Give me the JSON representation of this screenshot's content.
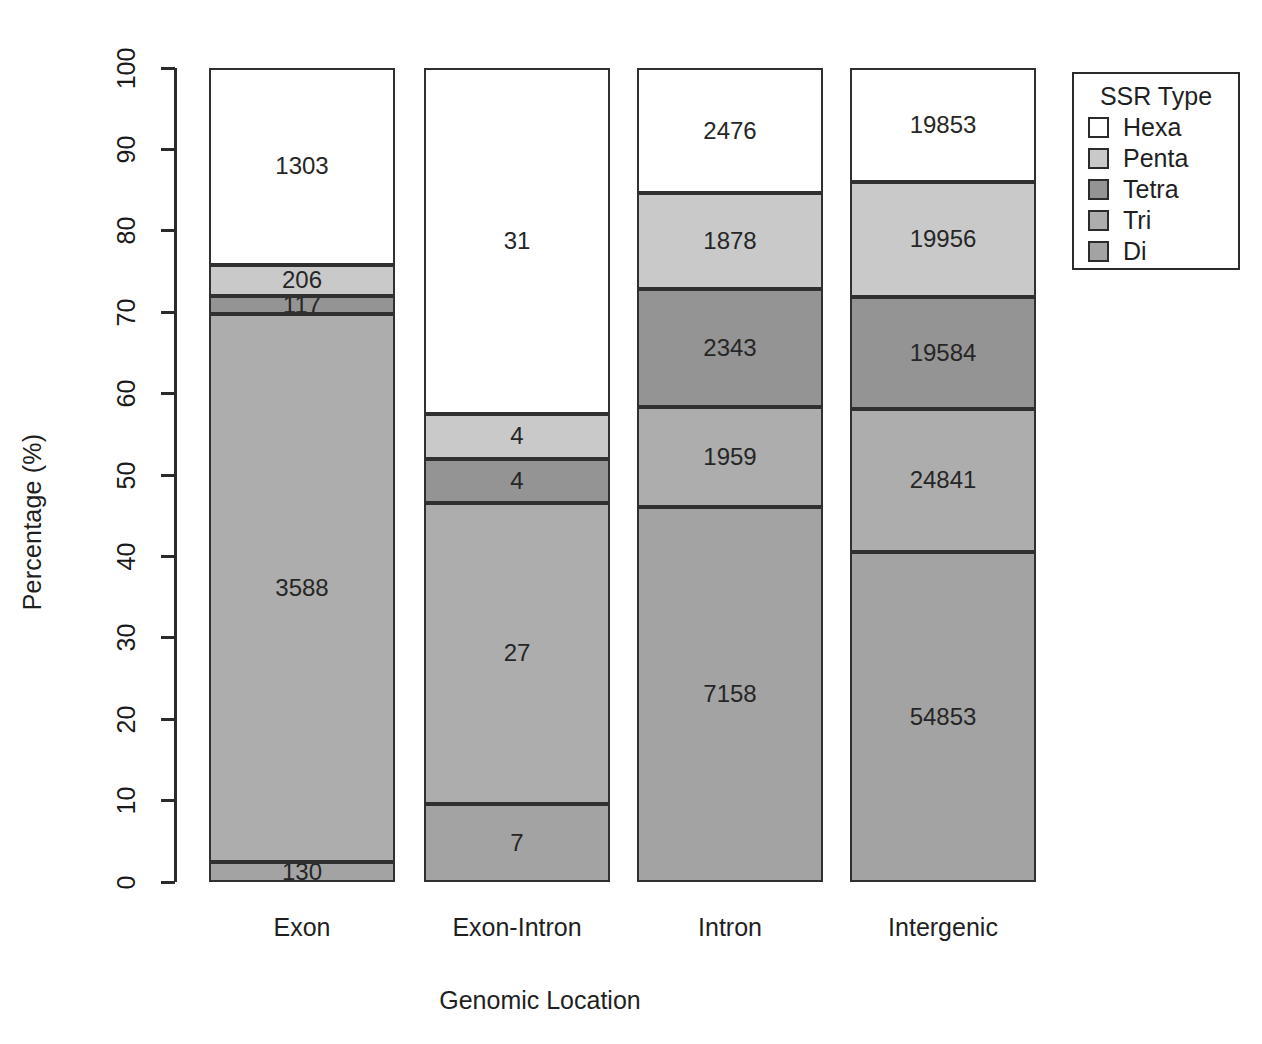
{
  "chart_data": {
    "type": "bar",
    "subtype": "stacked-percent",
    "title": "",
    "xlabel": "Genomic Location",
    "ylabel": "Percentage (%)",
    "ylim": [
      0,
      100
    ],
    "yticks": [
      0,
      10,
      20,
      30,
      40,
      50,
      60,
      70,
      80,
      90,
      100
    ],
    "ytick_labels": [
      "0",
      "10",
      "20",
      "30",
      "40",
      "50",
      "60",
      "70",
      "80",
      "90",
      "100"
    ],
    "grid": false,
    "legend": {
      "title": "SSR Type",
      "position": "right",
      "entries": [
        {
          "name": "Hexa",
          "color": "#ffffff"
        },
        {
          "name": "Penta",
          "color": "#c9c9c9"
        },
        {
          "name": "Tetra",
          "color": "#949494"
        },
        {
          "name": "Tri",
          "color": "#adadad"
        },
        {
          "name": "Di",
          "color": "#a3a3a3"
        }
      ]
    },
    "categories": [
      "Exon",
      "Exon-Intron",
      "Intron",
      "Intergenic"
    ],
    "stack_order_bottom_to_top": [
      "Di",
      "Tri",
      "Tetra",
      "Penta",
      "Hexa"
    ],
    "series": [
      {
        "name": "Hexa",
        "color": "#ffffff",
        "values": [
          1303,
          31,
          2476,
          19853
        ]
      },
      {
        "name": "Penta",
        "color": "#c9c9c9",
        "values": [
          206,
          4,
          1878,
          19956
        ]
      },
      {
        "name": "Tetra",
        "color": "#949494",
        "values": [
          117,
          4,
          2343,
          19584
        ]
      },
      {
        "name": "Tri",
        "color": "#adadad",
        "values": [
          3588,
          27,
          1959,
          24841
        ]
      },
      {
        "name": "Di",
        "color": "#a3a3a3",
        "values": [
          130,
          7,
          7158,
          54853
        ]
      }
    ],
    "percent_series": [
      {
        "name": "Hexa",
        "values": [
          24.2,
          42.5,
          15.4,
          14.0
        ]
      },
      {
        "name": "Penta",
        "values": [
          3.8,
          5.5,
          11.7,
          14.1
        ]
      },
      {
        "name": "Tetra",
        "values": [
          2.2,
          5.5,
          14.6,
          13.8
        ]
      },
      {
        "name": "Tri",
        "values": [
          67.4,
          37.0,
          12.2,
          17.5
        ]
      },
      {
        "name": "Di",
        "values": [
          2.4,
          9.6,
          44.6,
          38.7
        ]
      }
    ]
  },
  "bars": [
    {
      "category": "Exon",
      "segments": [
        {
          "type": "Hexa",
          "label": "1303",
          "color": "#ffffff",
          "bottom_pct": 75.8,
          "top_pct": 100.0
        },
        {
          "type": "Penta",
          "label": "206",
          "color": "#c9c9c9",
          "bottom_pct": 72.0,
          "top_pct": 75.8
        },
        {
          "type": "Tetra",
          "label": "117",
          "color": "#949494",
          "bottom_pct": 69.8,
          "top_pct": 72.0
        },
        {
          "type": "Tri",
          "label": "3588",
          "color": "#adadad",
          "bottom_pct": 2.4,
          "top_pct": 69.8
        },
        {
          "type": "Di",
          "label": "130",
          "color": "#a3a3a3",
          "bottom_pct": 0.0,
          "top_pct": 2.4
        }
      ]
    },
    {
      "category": "Exon-Intron",
      "segments": [
        {
          "type": "Hexa",
          "label": "31",
          "color": "#ffffff",
          "bottom_pct": 57.5,
          "top_pct": 100.0
        },
        {
          "type": "Penta",
          "label": "4",
          "color": "#c9c9c9",
          "bottom_pct": 52.0,
          "top_pct": 57.5
        },
        {
          "type": "Tetra",
          "label": "4",
          "color": "#949494",
          "bottom_pct": 46.6,
          "top_pct": 52.0
        },
        {
          "type": "Tri",
          "label": "27",
          "color": "#adadad",
          "bottom_pct": 9.6,
          "top_pct": 46.6
        },
        {
          "type": "Di",
          "label": "7",
          "color": "#a3a3a3",
          "bottom_pct": 0.0,
          "top_pct": 9.6
        }
      ]
    },
    {
      "category": "Intron",
      "segments": [
        {
          "type": "Hexa",
          "label": "2476",
          "color": "#ffffff",
          "bottom_pct": 84.6,
          "top_pct": 100.0
        },
        {
          "type": "Penta",
          "label": "1878",
          "color": "#c9c9c9",
          "bottom_pct": 72.9,
          "top_pct": 84.6
        },
        {
          "type": "Tetra",
          "label": "2343",
          "color": "#949494",
          "bottom_pct": 58.3,
          "top_pct": 72.9
        },
        {
          "type": "Tri",
          "label": "1959",
          "color": "#adadad",
          "bottom_pct": 46.1,
          "top_pct": 58.3
        },
        {
          "type": "Di",
          "label": "7158",
          "color": "#a3a3a3",
          "bottom_pct": 0.0,
          "top_pct": 46.1
        }
      ]
    },
    {
      "category": "Intergenic",
      "segments": [
        {
          "type": "Hexa",
          "label": "19853",
          "color": "#ffffff",
          "bottom_pct": 86.0,
          "top_pct": 100.0
        },
        {
          "type": "Penta",
          "label": "19956",
          "color": "#c9c9c9",
          "bottom_pct": 71.9,
          "top_pct": 86.0
        },
        {
          "type": "Tetra",
          "label": "19584",
          "color": "#949494",
          "bottom_pct": 58.1,
          "top_pct": 71.9
        },
        {
          "type": "Tri",
          "label": "24841",
          "color": "#adadad",
          "bottom_pct": 40.6,
          "top_pct": 58.1
        },
        {
          "type": "Di",
          "label": "54853",
          "color": "#a3a3a3",
          "bottom_pct": 0.0,
          "top_pct": 40.6
        }
      ]
    }
  ],
  "axes": {
    "y_title": "Percentage (%)",
    "x_title": "Genomic Location",
    "y_ticks": [
      "100",
      "90",
      "80",
      "70",
      "60",
      "50",
      "40",
      "30",
      "20",
      "10",
      "0"
    ]
  },
  "legend": {
    "title": "SSR Type",
    "items": [
      {
        "label": "Hexa",
        "color": "#ffffff"
      },
      {
        "label": "Penta",
        "color": "#c9c9c9"
      },
      {
        "label": "Tetra",
        "color": "#949494"
      },
      {
        "label": "Tri",
        "color": "#adadad"
      },
      {
        "label": "Di",
        "color": "#a3a3a3"
      }
    ]
  }
}
